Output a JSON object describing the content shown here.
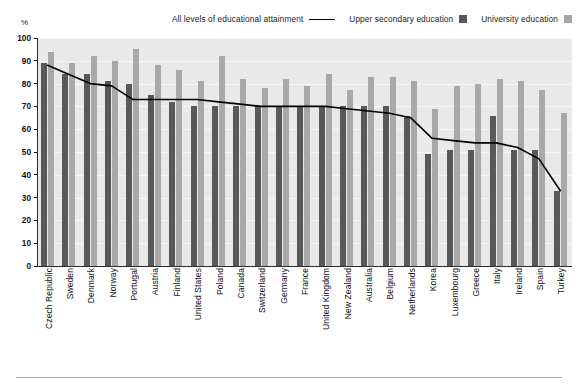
{
  "axis": {
    "unit_label": "%",
    "y_ticks": [
      100,
      90,
      80,
      70,
      60,
      50,
      40,
      30,
      20,
      10,
      0
    ]
  },
  "legend": {
    "items": [
      {
        "label": "All levels of educational attainment",
        "marker": "line",
        "color": "#000000"
      },
      {
        "label": "Upper secondary education",
        "marker": "square",
        "color": "#595959"
      },
      {
        "label": "University education",
        "marker": "square",
        "color": "#a8a8a8"
      }
    ]
  },
  "chart_data": {
    "type": "bar",
    "title": "",
    "xlabel": "",
    "ylabel": "%",
    "ylim": [
      0,
      100
    ],
    "grid": true,
    "legend_position": "top-right",
    "categories": [
      "Czech Republic",
      "Sweden",
      "Denmark",
      "Norway",
      "Portugal",
      "Austria",
      "Finland",
      "United States",
      "Poland",
      "Canada",
      "Switzerland",
      "Germany",
      "France",
      "United Kingdom",
      "New Zealand",
      "Australia",
      "Belgium",
      "Netherlands",
      "Korea",
      "Luxembourg",
      "Greece",
      "Italy",
      "Ireland",
      "Spain",
      "Turkey"
    ],
    "series": [
      {
        "name": "Upper secondary education",
        "type": "bar",
        "color": "#595959",
        "values": [
          89,
          84,
          84,
          81,
          80,
          75,
          72,
          70,
          70,
          70,
          70,
          70,
          70,
          70,
          70,
          70,
          70,
          66,
          49,
          51,
          51,
          66,
          51,
          51,
          33
        ]
      },
      {
        "name": "University education",
        "type": "bar",
        "color": "#a8a8a8",
        "values": [
          94,
          89,
          92,
          90,
          95,
          88,
          86,
          81,
          92,
          82,
          78,
          82,
          79,
          84,
          77,
          83,
          83,
          81,
          69,
          79,
          80,
          82,
          81,
          77,
          67
        ]
      },
      {
        "name": "All levels of educational attainment",
        "type": "line",
        "color": "#000000",
        "values": [
          88,
          84,
          80,
          79,
          73,
          73,
          73,
          73,
          72,
          71,
          70,
          70,
          70,
          70,
          69,
          68,
          67,
          65,
          56,
          55,
          54,
          54,
          52,
          47,
          33
        ]
      }
    ]
  }
}
